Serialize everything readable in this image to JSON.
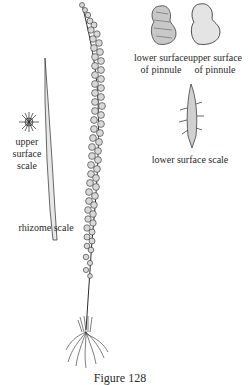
{
  "figure": {
    "caption": "Figure 128",
    "labels": {
      "lower_pinnule_line1": "lower surface",
      "lower_pinnule_line2": "of pinnule",
      "upper_pinnule_line1": "upper surface",
      "upper_pinnule_line2": "of pinnule",
      "upper_scale_line1": "upper",
      "upper_scale_line2": "surface",
      "upper_scale_line3": "scale",
      "lower_surface_scale": "lower surface scale",
      "rhizome_scale": "rhizome scale"
    }
  },
  "colors": {
    "ink": "#2a2a2a",
    "pinnule_fill": "#d8d8d8",
    "background": "#ffffff"
  }
}
